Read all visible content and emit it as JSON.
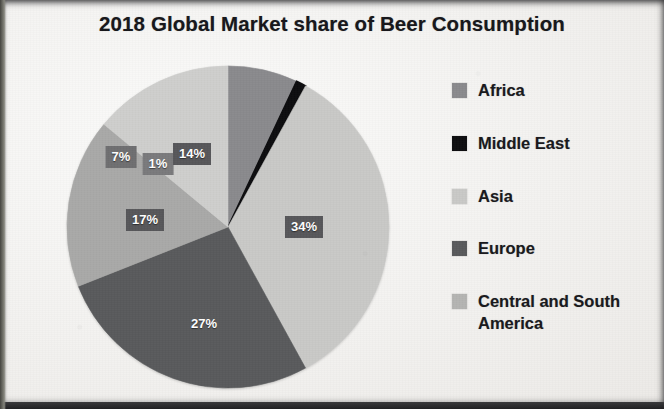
{
  "chart_data": {
    "type": "pie",
    "title": "2018 Global Market share of Beer Consumption",
    "xlabel": "",
    "ylabel": "",
    "legend_position": "right",
    "grid": false,
    "categories": [
      "Africa",
      "Middle East",
      "Asia",
      "Europe",
      "Central and South America",
      "North America"
    ],
    "values": [
      7,
      1,
      34,
      27,
      17,
      14
    ],
    "labels": [
      "7%",
      "1%",
      "34%",
      "27%",
      "17%",
      "14%"
    ],
    "colors": [
      "#8a8a8d",
      "#0d0d0f",
      "#c9c9c7",
      "#595a5c",
      "#a9a9a8",
      "#cfcfcd"
    ],
    "start_angle_deg": 0,
    "direction": "clockwise",
    "slices": [
      {
        "name": "Africa",
        "value": 7,
        "label": "7%",
        "color": "#8a8a8d",
        "start_deg": 0,
        "end_deg": 25.2
      },
      {
        "name": "Middle East",
        "value": 1,
        "label": "1%",
        "color": "#0d0d0f",
        "start_deg": 25.2,
        "end_deg": 28.8
      },
      {
        "name": "Asia",
        "value": 34,
        "label": "34%",
        "color": "#c9c9c7",
        "start_deg": 28.8,
        "end_deg": 151.2
      },
      {
        "name": "Europe",
        "value": 27,
        "label": "27%",
        "color": "#595a5c",
        "start_deg": 151.2,
        "end_deg": 248.4
      },
      {
        "name": "Central and South America",
        "value": 17,
        "label": "17%",
        "color": "#a9a9a8",
        "start_deg": 248.4,
        "end_deg": 309.6
      },
      {
        "name": "North America",
        "value": 14,
        "label": "14%",
        "color": "#cfcfcd",
        "start_deg": 309.6,
        "end_deg": 360
      }
    ]
  },
  "title": {
    "text": "2018 Global Market share of Beer Consumption"
  },
  "pie": {
    "data_labels": [
      {
        "id": "africa",
        "text": "7%",
        "x": 55,
        "y": 92
      },
      {
        "id": "middle-east",
        "text": "1%",
        "x": 92,
        "y": 99
      },
      {
        "id": "asia",
        "text": "34%",
        "x": 238,
        "y": 162
      },
      {
        "id": "europe",
        "text": "27%",
        "x": 138,
        "y": 259
      },
      {
        "id": "central-south-america",
        "text": "17%",
        "x": 79,
        "y": 155
      },
      {
        "id": "north-america",
        "text": "14%",
        "x": 126,
        "y": 89
      }
    ]
  },
  "legend": {
    "items": [
      {
        "label": "Africa",
        "color": "#8a8a8d"
      },
      {
        "label": "Middle East",
        "color": "#0d0d0f"
      },
      {
        "label": "Asia",
        "color": "#c9c9c7"
      },
      {
        "label": "Europe",
        "color": "#595a5c"
      },
      {
        "label": "Central and South\nAmerica",
        "color": "#b4b4b2"
      }
    ]
  }
}
